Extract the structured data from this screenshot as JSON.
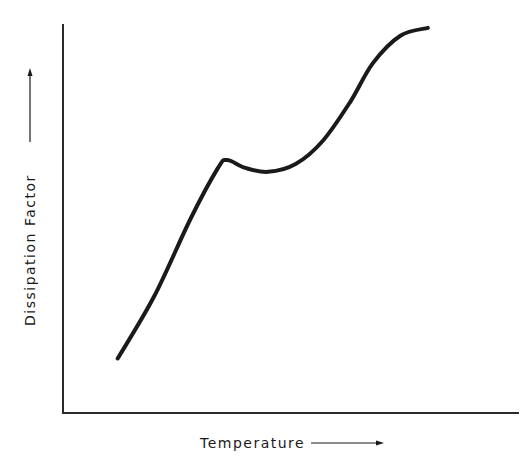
{
  "chart_data": {
    "type": "line",
    "title": "",
    "xlabel": "Temperature",
    "ylabel": "Dissipation Factor",
    "xlabel_arrow": "right",
    "ylabel_arrow": "up",
    "grid": false,
    "legend": null,
    "ticks": "none",
    "series": [
      {
        "name": "Dissipation Factor",
        "color": "#1a1a1a",
        "points_normalized": [
          {
            "x": 0.12,
            "y": 0.14
          },
          {
            "x": 0.2,
            "y": 0.3
          },
          {
            "x": 0.28,
            "y": 0.5
          },
          {
            "x": 0.34,
            "y": 0.63
          },
          {
            "x": 0.36,
            "y": 0.65
          },
          {
            "x": 0.4,
            "y": 0.63
          },
          {
            "x": 0.45,
            "y": 0.62
          },
          {
            "x": 0.51,
            "y": 0.64
          },
          {
            "x": 0.57,
            "y": 0.7
          },
          {
            "x": 0.63,
            "y": 0.8
          },
          {
            "x": 0.68,
            "y": 0.9
          },
          {
            "x": 0.74,
            "y": 0.97
          },
          {
            "x": 0.8,
            "y": 0.99
          }
        ]
      }
    ],
    "xlim": [
      0,
      1
    ],
    "ylim": [
      0,
      1
    ]
  },
  "colors": {
    "background": "#ffffff",
    "ink": "#1a1a1a",
    "axis": "#2a2a2a"
  }
}
